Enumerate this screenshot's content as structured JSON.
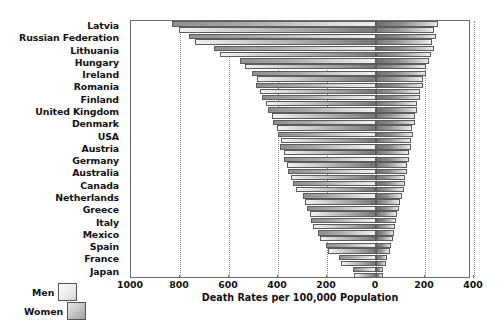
{
  "chart_data": {
    "type": "bar",
    "subtype": "population-pyramid-bidirectional",
    "title": "",
    "xlabel": "Death Rates per 100,000 Population",
    "ylabel": "",
    "categories": [
      "Latvia",
      "Russian Federation",
      "Lithuania",
      "Hungary",
      "Ireland",
      "Romania",
      "Finland",
      "United Kingdom",
      "Denmark",
      "USA",
      "Austria",
      "Germany",
      "Australia",
      "Canada",
      "Netherlands",
      "Greece",
      "Italy",
      "Mexico",
      "Spain",
      "France",
      "Japan"
    ],
    "series": [
      {
        "name": "Men",
        "direction": "left",
        "values": [
          832,
          765,
          660,
          555,
          505,
          490,
          465,
          440,
          420,
          400,
          390,
          375,
          360,
          340,
          300,
          280,
          265,
          235,
          205,
          150,
          95
        ]
      },
      {
        "name": "Women",
        "direction": "right",
        "values": [
          253,
          245,
          238,
          215,
          205,
          190,
          178,
          168,
          158,
          150,
          142,
          135,
          128,
          120,
          105,
          92,
          82,
          72,
          62,
          45,
          30
        ]
      }
    ],
    "xticks_left": [
      1000,
      800,
      600,
      400,
      200
    ],
    "xcenter": 0,
    "xticks_right": [
      200,
      400
    ],
    "xtick_labels": [
      "1000",
      "800",
      "600",
      "400",
      "200",
      "0",
      "200",
      "400"
    ],
    "xlim_left": 1000,
    "xlim_right": 388,
    "grid": true,
    "grid_style": "dotted-vertical",
    "legend_position": "bottom-left",
    "axis_color": "#6f6f6f",
    "grid_color": "#8a8a8a",
    "text_color": "#121212"
  },
  "legend": {
    "items": [
      {
        "label": "Men",
        "swatch": "light-gradient"
      },
      {
        "label": "Women",
        "swatch": "medium-gradient"
      }
    ]
  }
}
